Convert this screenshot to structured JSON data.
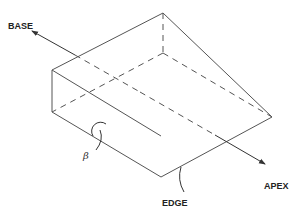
{
  "diagram": {
    "labels": {
      "base": "BASE",
      "apex": "APEX",
      "edge": "EDGE",
      "angle": "β"
    },
    "colors": {
      "line": "#555555",
      "text": "#222222",
      "background": "#ffffff"
    }
  }
}
